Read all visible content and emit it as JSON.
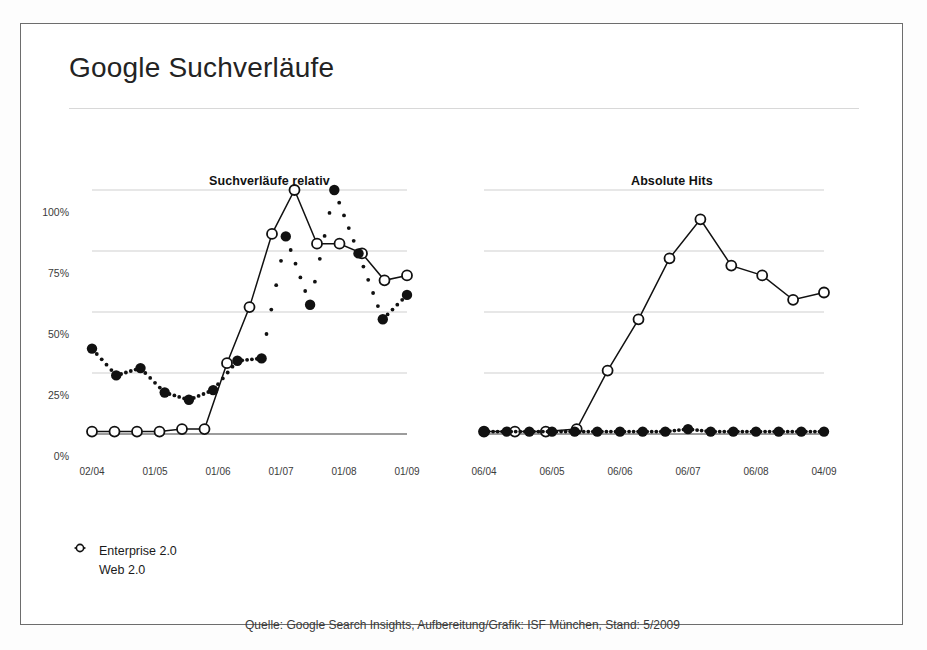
{
  "slide": {
    "title": "Google Suchverläufe",
    "source": "Quelle: Google Search Insights, Aufbereitung/Grafik: ISF München, Stand: 5/2009"
  },
  "legend": {
    "items": [
      {
        "label": "Enterprise 2.0",
        "marker": "filled-diamond-icon",
        "color": "#111111"
      },
      {
        "label": "Web 2.0",
        "marker": "open-circle-icon",
        "color": "#111111"
      }
    ]
  },
  "axis": {
    "y_ticks": [
      "100%",
      "75%",
      "50%",
      "25%",
      "0%"
    ],
    "left_x_ticks": [
      "02/04",
      "01/05",
      "01/06",
      "01/07",
      "01/08",
      "01/09"
    ],
    "right_x_ticks": [
      "06/04",
      "06/05",
      "06/06",
      "06/07",
      "06/08",
      "04/09"
    ]
  },
  "chart_data": [
    {
      "type": "line",
      "title": "Suchverläufe relativ",
      "xlabel": "",
      "ylabel": "",
      "ylim": [
        0,
        108
      ],
      "grid": true,
      "legend_position": "bottom-left",
      "x": [
        "02/04",
        "06/04",
        "10/04",
        "01/05",
        "05/05",
        "09/05",
        "01/06",
        "05/06",
        "09/06",
        "01/07",
        "05/07",
        "09/07",
        "01/08",
        "05/08",
        "09/08",
        "01/09",
        "05/09"
      ],
      "xtick_labels": [
        "02/04",
        "01/05",
        "01/06",
        "01/07",
        "01/08",
        "01/09"
      ],
      "series": [
        {
          "name": "Web 2.0",
          "marker": "open-circle",
          "line": "solid",
          "values": [
            1,
            1,
            1,
            1,
            2,
            2,
            29,
            52,
            82,
            100,
            78,
            78,
            74,
            63,
            65
          ]
        },
        {
          "name": "Enterprise 2.0",
          "marker": "filled-circle",
          "line": "dotted",
          "values": [
            35,
            24,
            27,
            17,
            14,
            18,
            30,
            31,
            81,
            53,
            100,
            74,
            47,
            57
          ]
        }
      ]
    },
    {
      "type": "line",
      "title": "Absolute Hits",
      "xlabel": "",
      "ylabel": "",
      "ylim": [
        0,
        108
      ],
      "grid": true,
      "legend_position": "bottom-left",
      "x": [
        "06/04",
        "12/04",
        "06/05",
        "12/05",
        "06/06",
        "12/06",
        "06/07",
        "12/07",
        "06/08",
        "12/08",
        "04/09"
      ],
      "xtick_labels": [
        "06/04",
        "06/05",
        "06/06",
        "06/07",
        "06/08",
        "04/09"
      ],
      "series": [
        {
          "name": "Web 2.0",
          "marker": "open-circle",
          "line": "solid",
          "values": [
            1,
            1,
            1,
            2,
            26,
            47,
            72,
            88,
            69,
            65,
            55,
            58
          ]
        },
        {
          "name": "Enterprise 2.0",
          "marker": "filled-circle",
          "line": "dotted",
          "values": [
            1,
            1,
            1,
            1,
            1,
            1,
            1,
            1,
            1,
            2,
            1,
            1,
            1,
            1,
            1,
            1
          ]
        }
      ]
    }
  ]
}
